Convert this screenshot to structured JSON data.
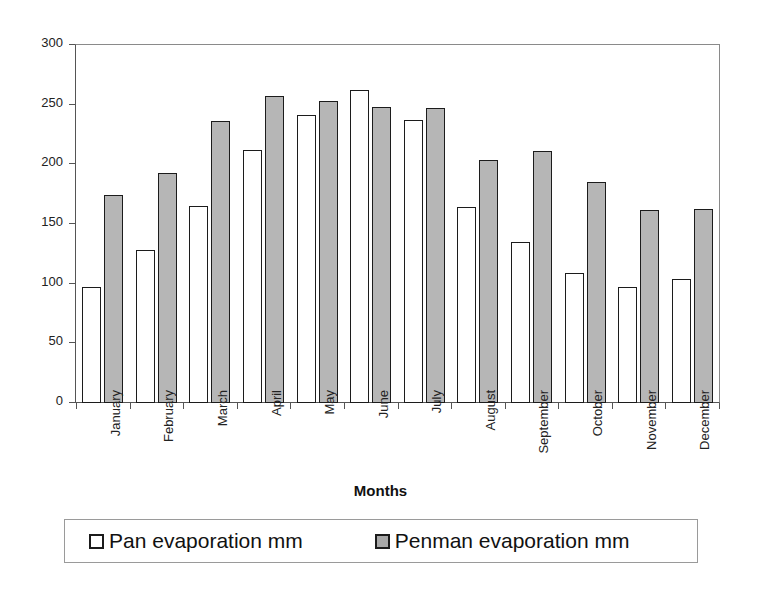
{
  "chart_data": {
    "type": "bar",
    "title": "",
    "xlabel": "Months",
    "ylabel": "Evaporation",
    "ylim": [
      0,
      300
    ],
    "yticks": [
      0,
      50,
      100,
      150,
      200,
      250,
      300
    ],
    "grid": false,
    "legend_position": "bottom",
    "categories": [
      "January",
      "February",
      "March",
      "April",
      "May",
      "June",
      "July",
      "August",
      "September",
      "October",
      "November",
      "December"
    ],
    "series": [
      {
        "name": "Pan evaporation mm",
        "color": "#ffffff",
        "values": [
          97,
          128,
          165,
          212,
          241,
          262,
          237,
          164,
          135,
          109,
          97,
          104
        ]
      },
      {
        "name": "Penman evaporation mm",
        "color": "#b6b6b6",
        "values": [
          174,
          193,
          236,
          257,
          253,
          248,
          247,
          204,
          211,
          185,
          162,
          163
        ]
      }
    ]
  },
  "legend": {
    "items": [
      {
        "label": "Pan evaporation mm",
        "swatch": "white-square-swatch"
      },
      {
        "label": "Penman evaporation mm",
        "swatch": "gray-square-swatch"
      }
    ]
  }
}
